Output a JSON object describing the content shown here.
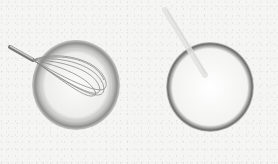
{
  "image": {
    "description": "Two bowls on a speckled white surface: a grey bowl with a wire whisk on the left, a white bowl with a pale liquid and a spoon on the right",
    "background_color": "#f5f5f3",
    "objects": [
      {
        "name": "left-bowl",
        "color": "#9a9a98",
        "contains": "whisk"
      },
      {
        "name": "whisk",
        "color": "#8c8c8c"
      },
      {
        "name": "right-bowl",
        "color": "#6a6a6a",
        "contains": "pale liquid"
      },
      {
        "name": "spoon",
        "color": "#d8d8d6"
      }
    ]
  }
}
